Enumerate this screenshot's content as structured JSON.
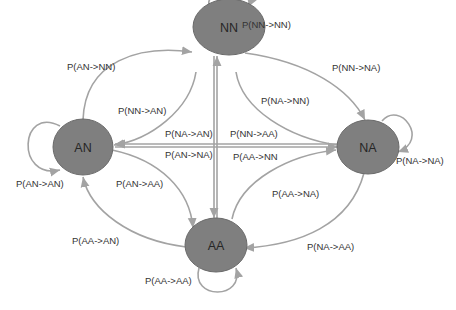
{
  "diagram": {
    "type": "state-transition",
    "nodes": [
      {
        "id": "NN",
        "label": "NN"
      },
      {
        "id": "AN",
        "label": "AN"
      },
      {
        "id": "NA",
        "label": "NA"
      },
      {
        "id": "AA",
        "label": "AA"
      }
    ],
    "edges": [
      {
        "from": "NN",
        "to": "NN",
        "label": "P(NN->NN)"
      },
      {
        "from": "AN",
        "to": "NN",
        "label": "P(AN->NN)"
      },
      {
        "from": "NN",
        "to": "AN",
        "label": "P(NN->AN)"
      },
      {
        "from": "NN",
        "to": "NA",
        "label": "P(NN->NA)"
      },
      {
        "from": "NA",
        "to": "NN",
        "label": "P(NA->NN)"
      },
      {
        "from": "NA",
        "to": "AN",
        "label": "P(NA->AN)"
      },
      {
        "from": "AN",
        "to": "NA",
        "label": "P(AN->NA)"
      },
      {
        "from": "NN",
        "to": "AA",
        "label": "P(NN->AA)"
      },
      {
        "from": "AA",
        "to": "NN",
        "label": "P(AA->NN"
      },
      {
        "from": "AN",
        "to": "AN",
        "label": "P(AN->AN)"
      },
      {
        "from": "NA",
        "to": "NA",
        "label": "P(NA->NA)"
      },
      {
        "from": "AN",
        "to": "AA",
        "label": "P(AN->AA)"
      },
      {
        "from": "AA",
        "to": "NA",
        "label": "P(AA->NA)"
      },
      {
        "from": "AA",
        "to": "AN",
        "label": "P(AA->AN)"
      },
      {
        "from": "NA",
        "to": "AA",
        "label": "P(NA->AA)"
      },
      {
        "from": "AA",
        "to": "AA",
        "label": "P(AA->AA)"
      }
    ],
    "colors": {
      "node_fill": "#7f7f7f",
      "edge_stroke": "#a3a3a3",
      "text": "#333333"
    }
  }
}
